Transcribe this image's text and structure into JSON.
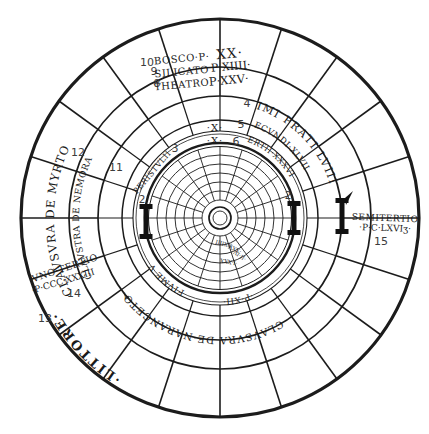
{
  "plan": {
    "ink_color": "#1c1c1c",
    "number_color": "#3c3c3c",
    "background": "#ffffff",
    "top_legend": {
      "rows": [
        {
          "num": "10",
          "name": "BOSCO·P·",
          "value": "XX·"
        },
        {
          "num": "9",
          "name": "SILICATO",
          "value": "P·XIIII·"
        },
        {
          "num": "8",
          "name": "THEATRO",
          "value": "P·XXV·"
        }
      ]
    },
    "meadow_arcs": {
      "primi_num": "4",
      "primi": "PRIMI PRATI LVIII·P·",
      "secundi_num": "5",
      "secundi": "SECVNDI·XLVIII",
      "tertii_num": "6",
      "tertii": "TERTII·XXXVIII"
    },
    "ring_marks": {
      "x_outer": "·X·",
      "x_inner": "·X·",
      "p_xii": "·P·XII·",
      "fiume": "FIVME V"
    },
    "sectors": {
      "peristylii_num": "3",
      "peristylii": "PERISTVLII",
      "nemora_num": "11",
      "nemora": "CLAVSTRA DE NEMORA",
      "myrto_num": "12",
      "myrto": "CLAVSVRA DE MYRTO",
      "naranceto_num": "7",
      "naranceto": "CLAVSVRA DE·NARANCETO",
      "littore_num": "13",
      "littore": "·LITTORE·"
    },
    "measures": {
      "uno_tertio_num": "14",
      "uno_tertio_line1": "VNO·TERTIO",
      "uno_tertio_line2": "·P·CCC·XXXIII",
      "semitertio_num": "15",
      "semitertio_line1": "SEMITERTIO",
      "semitertio_line2": "·P·C·LXVIʒ·"
    },
    "gates": {
      "left_num": "2",
      "right_num": "2"
    },
    "center_labels": [
      "·XXIIII",
      "·XXV·",
      "·II·IV",
      "·I·XXX"
    ]
  }
}
